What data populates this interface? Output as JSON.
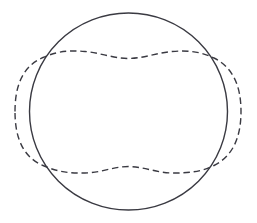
{
  "figure": {
    "background_color": "#ffffff",
    "stroke_color": "#3a3a42",
    "width": 257,
    "height": 223,
    "shapes": [
      {
        "name": "solid-circle",
        "style": "solid",
        "stroke_color": "#3a3a42",
        "stroke_width": 1.4,
        "center_x": 128.5,
        "center_y": 111.5,
        "radius": 99.0,
        "left_x": 29.5,
        "right_x": 227.5,
        "top_y": 13.5,
        "bottom_y": 210.5,
        "path": "M 227.5 111.5 A 99 98.5 0 1 1 29.5 111.5 A 99 98.5 0 1 1 227.5 111.5 Z"
      },
      {
        "name": "dashed-wavy-closed-curve",
        "style": "dashed",
        "stroke_color": "#3a3a42",
        "stroke_width": 1.4,
        "dash_length": 6.5,
        "gap_length": 3.8,
        "left_extreme_x": 15.0,
        "right_extreme_x": 241.0,
        "top_apex_y": 51.0,
        "bottom_apex_y": 173.0,
        "center_dip_top": {
          "x": 128.5,
          "y": 58.5
        },
        "center_bump_bottom": {
          "x": 128.5,
          "y": 166.5
        },
        "hump_left_top": {
          "x": 85.0,
          "y": 51.5
        },
        "hump_right_top": {
          "x": 172.0,
          "y": 51.5
        },
        "dip_left_bottom": {
          "x": 85.0,
          "y": 173.0
        },
        "dip_right_bottom": {
          "x": 172.0,
          "y": 173.0
        },
        "path": "M 15 111.5 C 15 85 23 66 43 57.5 C 60 50 72 50.5 85 51.5 C 100 52.8 113 58.3 128.5 58.5 C 144 58.3 157 52.8 172 51.5 C 186 50.4 200 51 214 58 C 233 67.5 241 86 241 111.5 C 241 137 233 156 214 165.5 C 200 172.5 186 173.1 172 173 C 157 172.9 144 166.7 128.5 166.5 C 113 166.7 100 172.9 85 173 C 72 173.1 60 173 43 165.5 C 23 157 15 138 15 111.5 Z"
      }
    ],
    "intersections": [
      {
        "name": "upper-left-intersection",
        "x": 43,
        "y": 58
      },
      {
        "name": "upper-right-intersection",
        "x": 210,
        "y": 57
      },
      {
        "name": "lower-left-intersection",
        "x": 46,
        "y": 163
      },
      {
        "name": "lower-right-intersection",
        "x": 208,
        "y": 165
      }
    ]
  }
}
